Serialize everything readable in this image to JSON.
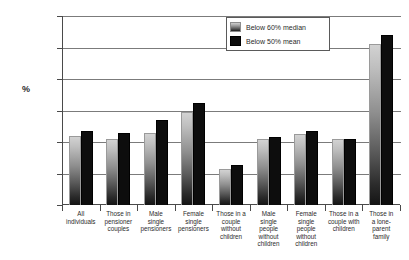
{
  "chart_data": {
    "type": "bar",
    "title": "",
    "xlabel": "",
    "ylabel": "%",
    "ylim": [
      0,
      60
    ],
    "yticks": [
      0,
      10,
      20,
      30,
      40,
      50,
      60
    ],
    "grid": true,
    "legend_position": "upper-right",
    "categories": [
      "All individuals",
      "Those in pensioner couples",
      "Male single pensioners",
      "Female single pensioners",
      "Those in a couple without children",
      "Male single people without children",
      "Female single people without children",
      "Those in a couple with children",
      "Those in a lone-parent family"
    ],
    "category_lines": [
      [
        "All",
        "individuals"
      ],
      [
        "Those in",
        "pensioner",
        "couples"
      ],
      [
        "Male",
        "single",
        "pensioners"
      ],
      [
        "Female",
        "single",
        "pensioners"
      ],
      [
        "Those in a",
        "couple",
        "without",
        "children"
      ],
      [
        "Male",
        "single",
        "people",
        "without",
        "children"
      ],
      [
        "Female",
        "single",
        "people",
        "without",
        "children"
      ],
      [
        "Those in a",
        "couple with",
        "children"
      ],
      [
        "Those in",
        "a lone-",
        "parent",
        "family"
      ]
    ],
    "series": [
      {
        "name": "Below 60% median",
        "color": "#8f8f8f",
        "values": [
          22,
          20.8,
          23,
          29.5,
          11.5,
          21,
          22.5,
          21,
          51
        ]
      },
      {
        "name": "Below 50% mean",
        "color": "#0d0d0d",
        "values": [
          23.5,
          23,
          27,
          32.5,
          12.8,
          21.5,
          23.5,
          21,
          54
        ]
      }
    ]
  }
}
